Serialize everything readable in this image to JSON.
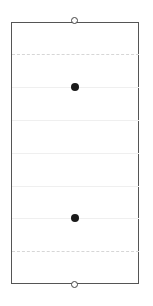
{
  "diagram": {
    "frame": {
      "left": 11,
      "top": 22,
      "width": 128,
      "height": 262,
      "stroke": "#555555"
    },
    "lines": [
      {
        "y": 54,
        "style": "dashed"
      },
      {
        "y": 87,
        "style": "solid"
      },
      {
        "y": 120,
        "style": "solid"
      },
      {
        "y": 153,
        "style": "solid"
      },
      {
        "y": 186,
        "style": "solid"
      },
      {
        "y": 218,
        "style": "solid"
      },
      {
        "y": 251,
        "style": "dashed"
      }
    ],
    "end_markers": [
      {
        "type": "open-circle",
        "x": 75,
        "y": 22
      },
      {
        "type": "open-circle",
        "x": 75,
        "y": 285
      }
    ],
    "dots": [
      {
        "type": "filled-circle",
        "x": 75,
        "y": 87
      },
      {
        "type": "filled-circle",
        "x": 75,
        "y": 218
      }
    ],
    "colors": {
      "frame": "#555555",
      "dashed_line": "#d6d6d6",
      "solid_line": "#efefef",
      "dot": "#1a1a1a",
      "background": "#ffffff"
    }
  }
}
